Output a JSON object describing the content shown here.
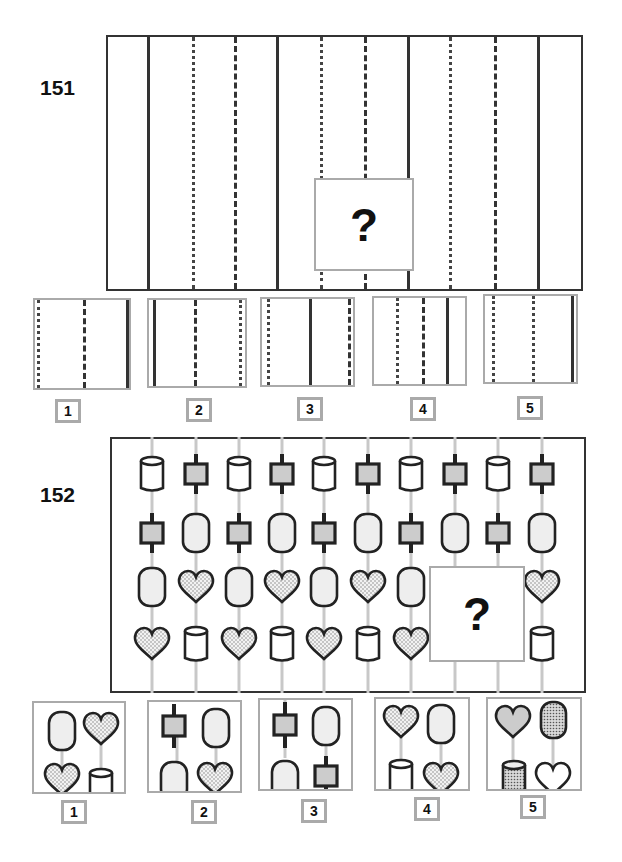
{
  "puzzles": [
    {
      "number": "151",
      "question_mark": "?",
      "main_grid": {
        "line_pattern": [
          "solid",
          "dotted",
          "dashed",
          "solid",
          "dotted",
          "dashed",
          "solid",
          "dotted",
          "dashed",
          "solid"
        ],
        "missing_region": "lower portion containing a dotted line, a dashed line and a solid line"
      },
      "options": [
        {
          "label": "1",
          "lines": [
            "dotted",
            "dashed",
            "solid"
          ]
        },
        {
          "label": "2",
          "lines": [
            "solid",
            "dashed",
            "dotted"
          ]
        },
        {
          "label": "3",
          "lines": [
            "dotted",
            "solid",
            "dashed"
          ]
        },
        {
          "label": "4",
          "lines": [
            "dotted",
            "dashed",
            "solid"
          ]
        },
        {
          "label": "5",
          "lines": [
            "dotted",
            "dotted",
            "solid"
          ]
        }
      ]
    },
    {
      "number": "152",
      "question_mark": "?",
      "main_grid": {
        "rows": [
          [
            "cylinder",
            "square-node",
            "cylinder",
            "square-node",
            "cylinder",
            "square-node",
            "cylinder",
            "square-node",
            "cylinder",
            "square-node"
          ],
          [
            "square-node",
            "capsule",
            "square-node",
            "capsule",
            "square-node",
            "capsule",
            "square-node",
            "capsule",
            "square-node",
            "capsule"
          ],
          [
            "capsule",
            "dotted-heart",
            "capsule",
            "dotted-heart",
            "capsule",
            "dotted-heart",
            "capsule",
            "?",
            "?",
            "dotted-heart"
          ],
          [
            "dotted-heart",
            "cylinder",
            "dotted-heart",
            "cylinder",
            "dotted-heart",
            "cylinder",
            "dotted-heart",
            "?",
            "?",
            "cylinder"
          ]
        ]
      },
      "options": [
        {
          "label": "1",
          "top": [
            "capsule",
            "dotted-heart"
          ],
          "bottom": [
            "dotted-heart",
            "cylinder"
          ]
        },
        {
          "label": "2",
          "top": [
            "square-node",
            "capsule"
          ],
          "bottom": [
            "capsule",
            "dotted-heart"
          ]
        },
        {
          "label": "3",
          "top": [
            "square-node",
            "capsule"
          ],
          "bottom": [
            "capsule",
            "square-node"
          ]
        },
        {
          "label": "4",
          "top": [
            "dotted-heart",
            "capsule"
          ],
          "bottom": [
            "cylinder",
            "dotted-heart"
          ]
        },
        {
          "label": "5",
          "top": [
            "gray-heart",
            "dotted-capsule"
          ],
          "bottom": [
            "dotted-cylinder",
            "white-heart"
          ]
        }
      ]
    }
  ],
  "colors": {
    "outline": "#333333",
    "option_border": "#aaaaaa",
    "guide_line": "#c8c8c8",
    "fill_light": "#eeeeee",
    "fill_square": "#cccccc"
  }
}
